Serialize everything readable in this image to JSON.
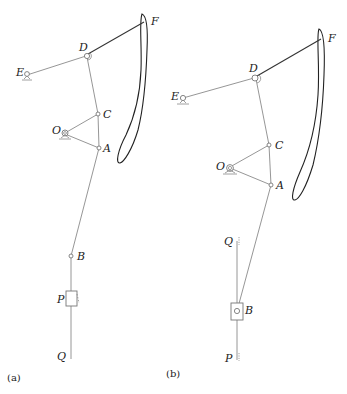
{
  "figure": {
    "panels": [
      {
        "caption": "(a)",
        "labels": {
          "D": "D",
          "E": "E",
          "F": "F",
          "C": "C",
          "O": "O",
          "A": "A",
          "B": "B",
          "P": "P",
          "Q": "Q"
        }
      },
      {
        "caption": "(b)",
        "labels": {
          "D": "D",
          "E": "E",
          "F": "F",
          "C": "C",
          "O": "O",
          "A": "A",
          "B": "B",
          "P": "P",
          "Q": "Q"
        }
      }
    ]
  },
  "colors": {
    "link": "#8a8a8a",
    "curve": "#222222",
    "text": "#222222"
  }
}
